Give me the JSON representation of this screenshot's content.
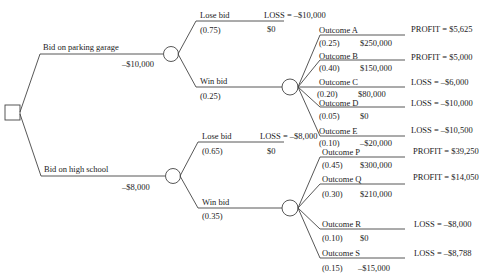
{
  "decision": {
    "options": [
      {
        "label": "Bid on parking garage",
        "cost": "–$10,000",
        "lose": {
          "label": "Lose bid",
          "prob": "(0.75)",
          "value": "$0",
          "result": "LOSS = –$10,000"
        },
        "win": {
          "label": "Win bid",
          "prob": "(0.25)",
          "outcomes": [
            {
              "label": "Outcome A",
              "prob": "(0.25)",
              "value": "$250,000",
              "result": "PROFIT = $5,625"
            },
            {
              "label": "Outcome B",
              "prob": "(0.40)",
              "value": "$150,000",
              "result": "PROFIT = $5,000"
            },
            {
              "label": "Outcome C",
              "prob": "(0.20)",
              "value": "$80,000",
              "result": "LOSS = –$6,000"
            },
            {
              "label": "Outcome D",
              "prob": "(0.05)",
              "value": "$0",
              "result": "LOSS = –$10,000"
            },
            {
              "label": "Outcome E",
              "prob": "(0.10)",
              "value": "–$20,000",
              "result": "LOSS = –$10,500"
            }
          ]
        }
      },
      {
        "label": "Bid on high school",
        "cost": "–$8,000",
        "lose": {
          "label": "Lose bid",
          "prob": "(0.65)",
          "value": "$0",
          "result": "LOSS = –$8,000"
        },
        "win": {
          "label": "Win bid",
          "prob": "(0.35)",
          "outcomes": [
            {
              "label": "Outcome P",
              "prob": "(0.45)",
              "value": "$300,000",
              "result": "PROFIT = $39,250"
            },
            {
              "label": "Outcome Q",
              "prob": "(0.30)",
              "value": "$210,000",
              "result": "PROFIT = $14,050"
            },
            {
              "label": "Outcome R",
              "prob": "(0.10)",
              "value": "$0",
              "result": "LOSS = –$8,000"
            },
            {
              "label": "Outcome S",
              "prob": "(0.15)",
              "value": "–$15,000",
              "result": "LOSS = –$8,788"
            }
          ]
        }
      }
    ]
  },
  "colors": {
    "line": "#444444",
    "text": "#222222"
  }
}
